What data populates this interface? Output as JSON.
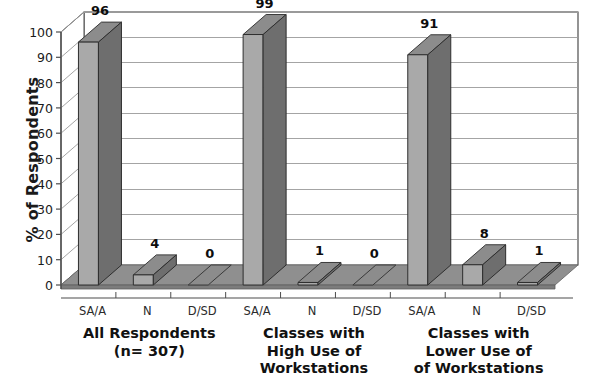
{
  "chart_data": {
    "type": "bar",
    "title": "",
    "xlabel": "",
    "ylabel": "% of Respondents",
    "ylim": [
      0,
      100
    ],
    "ytick_values": [
      0,
      10,
      20,
      30,
      40,
      50,
      60,
      70,
      80,
      90,
      100
    ],
    "grid": true,
    "legend": "none",
    "style": "3d-column",
    "categories": [
      "SA/A",
      "N",
      "D/SD"
    ],
    "groups": [
      {
        "label_lines": [
          "All Respondents",
          "(n= 307)"
        ],
        "categories": [
          "SA/A",
          "N",
          "D/SD"
        ],
        "values": [
          96,
          4,
          0
        ]
      },
      {
        "label_lines": [
          "Classes with",
          "High Use of",
          "Workstations"
        ],
        "categories": [
          "SA/A",
          "N",
          "D/SD"
        ],
        "values": [
          99,
          1,
          0
        ]
      },
      {
        "label_lines": [
          "Classes with",
          "Lower Use of",
          "of Workstations"
        ],
        "categories": [
          "SA/A",
          "N",
          "D/SD"
        ],
        "values": [
          91,
          8,
          1
        ]
      }
    ],
    "series": [
      {
        "name": "All Respondents (n= 307)",
        "values": [
          96,
          4,
          0
        ]
      },
      {
        "name": "Classes with High Use of Workstations",
        "values": [
          99,
          1,
          0
        ]
      },
      {
        "name": "Classes with Lower Use of of Workstations",
        "values": [
          91,
          8,
          1
        ]
      }
    ],
    "colors": {
      "bar_front": "#a9a9a9",
      "bar_side": "#6e6e6e",
      "bar_top": "#8c8c8c",
      "floor": "#8f8f8f",
      "gridline": "#9a9a9a",
      "axis": "#4d4d4d",
      "text": "#111111",
      "background": "#ffffff"
    }
  }
}
